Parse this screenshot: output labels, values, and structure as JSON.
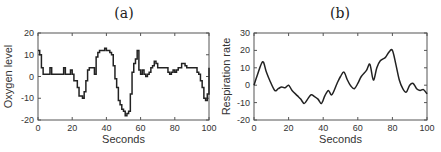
{
  "chart_data": [
    {
      "type": "line",
      "panel_label": "(a)",
      "title": "(a)",
      "xlabel": "Seconds",
      "ylabel": "Oxygen level",
      "xlim": [
        0,
        100
      ],
      "ylim": [
        -20,
        20
      ],
      "xticks": [
        0,
        20,
        40,
        60,
        80,
        100
      ],
      "yticks": [
        -20,
        -10,
        0,
        10,
        20
      ],
      "grid": false,
      "style": "step",
      "x": [
        0,
        1,
        2,
        3,
        4,
        6,
        7,
        8,
        14,
        15,
        16,
        18,
        19,
        20,
        21,
        22,
        23,
        24,
        26,
        27,
        28,
        29,
        30,
        32,
        33,
        34,
        35,
        36,
        37,
        38,
        39,
        40,
        41,
        42,
        43,
        44,
        45,
        46,
        47,
        48,
        49,
        50,
        51,
        52,
        53,
        54,
        55,
        56,
        57,
        58,
        59,
        60,
        61,
        62,
        63,
        64,
        65,
        66,
        67,
        68,
        69,
        70,
        71,
        72,
        75,
        76,
        77,
        78,
        79,
        80,
        81,
        82,
        84,
        85,
        86,
        87,
        88,
        89,
        90,
        91,
        92,
        93,
        94,
        95,
        96,
        97,
        98,
        99,
        100
      ],
      "y": [
        12,
        10,
        4,
        1,
        1,
        1,
        4,
        1,
        1,
        4,
        1,
        1,
        3,
        1,
        -2,
        -2,
        -5,
        -9,
        -10,
        -7,
        -2,
        3,
        4,
        4,
        1,
        9,
        11,
        12,
        12,
        12,
        13,
        12,
        12,
        11,
        10,
        5,
        -1,
        -5,
        -11,
        -13,
        -15,
        -16,
        -18,
        -17,
        -16,
        -8,
        2,
        6,
        8,
        12,
        3,
        1,
        3,
        1,
        0,
        1,
        2,
        4,
        5,
        7,
        6,
        4,
        4,
        4,
        4,
        2,
        1,
        2,
        3,
        2,
        3,
        4,
        6,
        6,
        5,
        4,
        4,
        4,
        4,
        4,
        4,
        2,
        1,
        -2,
        -5,
        -10,
        -11,
        -8,
        4
      ],
      "end_value": 4
    },
    {
      "type": "line",
      "panel_label": "(b)",
      "title": "(b)",
      "xlabel": "Seconds",
      "ylabel": "Respiration rate",
      "xlim": [
        0,
        100
      ],
      "ylim": [
        -20,
        30
      ],
      "xticks": [
        0,
        20,
        40,
        60,
        80,
        100
      ],
      "yticks": [
        -20,
        -10,
        0,
        10,
        20,
        30
      ],
      "grid": false,
      "style": "smooth",
      "x": [
        0,
        2,
        5,
        7,
        9,
        12,
        14,
        16,
        18,
        20,
        22,
        25,
        27,
        29,
        31,
        33,
        35,
        37,
        39,
        41,
        43,
        45,
        48,
        50,
        52,
        54,
        56,
        58,
        60,
        62,
        65,
        67,
        69,
        71,
        73,
        76,
        78,
        80,
        82,
        84,
        86,
        88,
        90,
        92,
        94,
        96,
        98,
        100
      ],
      "y": [
        0,
        6,
        13.5,
        8,
        3,
        -3,
        -2,
        -1,
        -1.5,
        0,
        -3,
        -6,
        -8,
        -10.5,
        -8,
        -5.5,
        -6.5,
        -8,
        -10.5,
        -6,
        -3,
        -5.5,
        1,
        5,
        7.5,
        3,
        -0.5,
        -2,
        1,
        5,
        8.5,
        12,
        3,
        10,
        14,
        16,
        19,
        20,
        12,
        3,
        -2,
        -4,
        0,
        1,
        -2,
        -3,
        -2.5,
        -5
      ]
    }
  ]
}
